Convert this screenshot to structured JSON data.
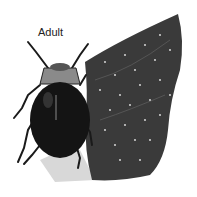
{
  "illustration": {
    "label": "Adult",
    "subject": "beetle on leaf",
    "colors": {
      "background": "#ffffff",
      "beetle_body": "#141414",
      "pronotum": "#8a8a8a",
      "leaf": "#3a3a3a",
      "leaf_light": "#cfcfcf",
      "spots": "#e8e8e8"
    }
  }
}
